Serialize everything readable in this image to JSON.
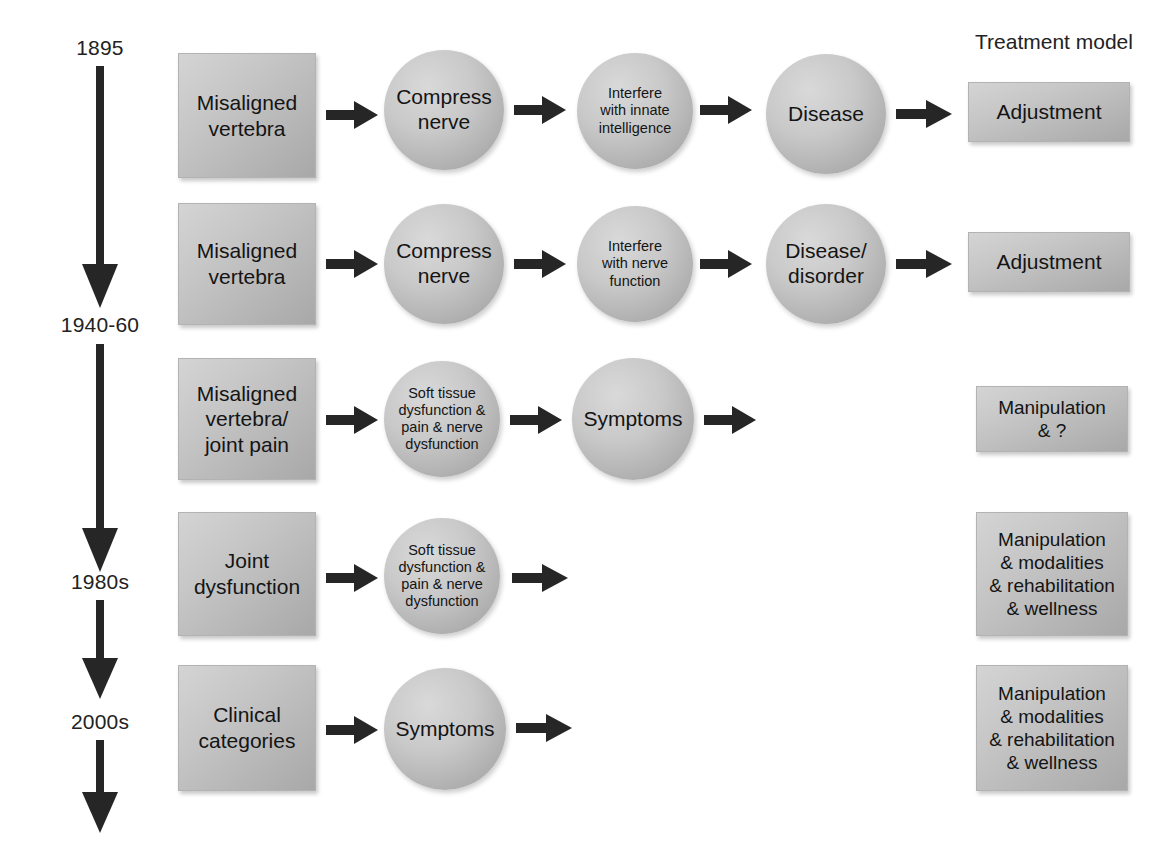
{
  "figure": {
    "type": "flow-diagram",
    "title": "",
    "background_color": "#ffffff",
    "node_fill": "#c4c4c4",
    "arrow_color": "#262626"
  },
  "column_headers": {
    "treatment_model": "Treatment model"
  },
  "timeline": {
    "labels": [
      "1895",
      "1940-60",
      "1980s",
      "2000s"
    ],
    "arrow_count": 4,
    "direction": "down"
  },
  "rows": [
    {
      "era": "1895",
      "cause_box": "Misaligned\nvertebra",
      "stages": [
        "Compress\nnerve",
        "Interfere\nwith innate\nintelligence",
        "Disease"
      ],
      "treatment": "Adjustment"
    },
    {
      "era": "1940-60",
      "cause_box": "Misaligned\nvertebra",
      "stages": [
        "Compress\nnerve",
        "Interfere\nwith nerve\nfunction",
        "Disease/\ndisorder"
      ],
      "treatment": "Adjustment"
    },
    {
      "era": "1940-60",
      "cause_box": "Misaligned\nvertebra/\njoint pain",
      "stages": [
        "Soft tissue\ndysfunction &\npain & nerve\ndysfunction",
        "Symptoms"
      ],
      "treatment": "Manipulation\n& ?"
    },
    {
      "era": "1980s",
      "cause_box": "Joint\ndysfunction",
      "stages": [
        "Soft tissue\ndysfunction &\npain & nerve\ndysfunction"
      ],
      "treatment": "Manipulation\n& modalities\n& rehabilitation\n& wellness"
    },
    {
      "era": "2000s",
      "cause_box": "Clinical\ncategories",
      "stages": [
        "Symptoms"
      ],
      "treatment": "Manipulation\n& modalities\n& rehabilitation\n& wellness"
    }
  ]
}
